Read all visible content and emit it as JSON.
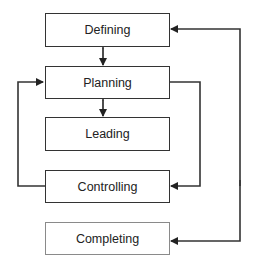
{
  "diagram": {
    "boxes": [
      {
        "id": "defining",
        "label": "Defining",
        "style": "normal"
      },
      {
        "id": "planning",
        "label": "Planning",
        "style": "normal"
      },
      {
        "id": "leading",
        "label": "Leading",
        "style": "normal"
      },
      {
        "id": "controlling",
        "label": "Controlling",
        "style": "normal"
      },
      {
        "id": "completing",
        "label": "Completing",
        "style": "faded"
      }
    ],
    "connections": [
      {
        "from": "defining",
        "to": "planning",
        "type": "bidirectional"
      },
      {
        "from": "planning",
        "to": "leading",
        "type": "bidirectional"
      },
      {
        "from": "planning",
        "to": "controlling",
        "type": "loop-right"
      },
      {
        "from": "controlling",
        "to": "planning",
        "type": "loop-left"
      },
      {
        "from": "outer-loop",
        "to": "defining",
        "type": "arrow"
      },
      {
        "from": "outer-loop",
        "to": "completing",
        "type": "arrow"
      }
    ],
    "colors": {
      "line": "#333333",
      "faded_border": "#8a8a8a",
      "text": "#222222"
    }
  }
}
